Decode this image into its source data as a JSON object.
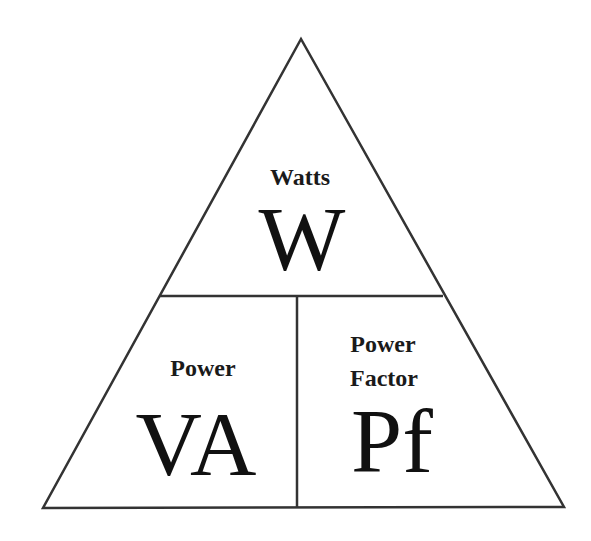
{
  "diagram": {
    "colors": {
      "stroke": "#333333",
      "text": "#111111",
      "background": "#ffffff"
    },
    "top_section": {
      "label": "Watts",
      "symbol": "W"
    },
    "bottom_left_section": {
      "label": "Power",
      "symbol": "VA"
    },
    "bottom_right_section": {
      "label_line1": "Power",
      "label_line2": "Factor",
      "symbol": "Pf"
    }
  }
}
